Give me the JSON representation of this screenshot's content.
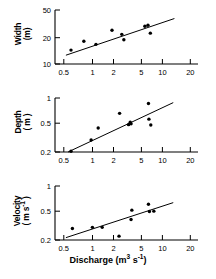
{
  "figure": {
    "xaxis_title_main": "Discharge",
    "xaxis_title_units": "(m",
    "xaxis_title_units_exp": "3",
    "xaxis_title_units_tail": " s",
    "xaxis_title_units_exp2": "-1",
    "xaxis_title_units_close": ")",
    "xaxis_title_full": "Discharge (m3 s-1)"
  },
  "panels": {
    "width": {
      "ylabel_line1": "Width",
      "ylabel_line2": "(m)",
      "yticks": [
        "10",
        "20",
        "50"
      ],
      "xticks": [
        "0.5",
        "1",
        "2",
        "5",
        "10",
        "20"
      ]
    },
    "depth": {
      "ylabel_line1": "Depth",
      "ylabel_line2": "( m )",
      "yticks": [
        "0.2",
        "0.5",
        "1"
      ],
      "xticks": [
        "0.5",
        "1",
        "2",
        "5",
        "10",
        "20"
      ]
    },
    "velocity": {
      "ylabel_line1": "Velocity",
      "ylabel_line2": "( m s-1 )",
      "ylabel_line2_pre": "( m s",
      "ylabel_line2_exp": "-1",
      "ylabel_line2_post": " )",
      "yticks": [
        "0.2",
        "0.5",
        "1"
      ],
      "xticks": [
        "0.5",
        "1",
        "2",
        "5",
        "10",
        "20"
      ]
    }
  },
  "chart_data": [
    {
      "type": "scatter",
      "title": "Width vs Discharge",
      "xlabel": "Discharge (m3 s-1)",
      "ylabel": "Width (m)",
      "xscale": "log",
      "yscale": "log",
      "xlim": [
        0.45,
        30
      ],
      "ylim": [
        10,
        55
      ],
      "xticks": [
        0.5,
        1,
        2,
        5,
        10,
        20
      ],
      "yticks": [
        10,
        20,
        50
      ],
      "grid": false,
      "legend": "none",
      "points": [
        {
          "x": 0.72,
          "y": 15.5
        },
        {
          "x": 1.05,
          "y": 20.5
        },
        {
          "x": 1.5,
          "y": 18.6
        },
        {
          "x": 2.4,
          "y": 29.0
        },
        {
          "x": 3.2,
          "y": 25.5
        },
        {
          "x": 3.4,
          "y": 21.5
        },
        {
          "x": 6.3,
          "y": 33.0
        },
        {
          "x": 6.9,
          "y": 34.0
        },
        {
          "x": 7.4,
          "y": 26.5
        }
      ],
      "fit_line": {
        "x": [
          0.62,
          15.0
        ],
        "y": [
          13.2,
          42.0
        ]
      }
    },
    {
      "type": "scatter",
      "title": "Depth vs Discharge",
      "xlabel": "Discharge (m3 s-1)",
      "ylabel": "Depth (m)",
      "xscale": "log",
      "yscale": "log",
      "xlim": [
        0.45,
        30
      ],
      "ylim": [
        0.2,
        1.15
      ],
      "xticks": [
        0.5,
        1,
        2,
        5,
        10,
        20
      ],
      "yticks": [
        0.2,
        0.5,
        1
      ],
      "grid": false,
      "legend": "none",
      "points": [
        {
          "x": 0.72,
          "y": 0.205
        },
        {
          "x": 1.3,
          "y": 0.295
        },
        {
          "x": 1.6,
          "y": 0.435
        },
        {
          "x": 3.0,
          "y": 0.7
        },
        {
          "x": 3.9,
          "y": 0.485
        },
        {
          "x": 4.1,
          "y": 0.525
        },
        {
          "x": 4.2,
          "y": 0.5
        },
        {
          "x": 7.0,
          "y": 0.96
        },
        {
          "x": 7.1,
          "y": 0.58
        },
        {
          "x": 7.5,
          "y": 0.48
        }
      ],
      "fit_line": {
        "x": [
          0.66,
          14.5
        ],
        "y": [
          0.2,
          0.99
        ]
      }
    },
    {
      "type": "scatter",
      "title": "Velocity vs Discharge",
      "xlabel": "Discharge (m3 s-1)",
      "ylabel": "Velocity (m s-1)",
      "xscale": "log",
      "yscale": "log",
      "xlim": [
        0.45,
        30
      ],
      "ylim": [
        0.2,
        1.05
      ],
      "xticks": [
        0.5,
        1,
        2,
        5,
        10,
        20
      ],
      "yticks": [
        0.2,
        0.5,
        1
      ],
      "grid": false,
      "legend": "none",
      "points": [
        {
          "x": 0.75,
          "y": 0.285
        },
        {
          "x": 1.35,
          "y": 0.295
        },
        {
          "x": 1.8,
          "y": 0.295
        },
        {
          "x": 2.95,
          "y": 0.225
        },
        {
          "x": 4.2,
          "y": 0.375
        },
        {
          "x": 4.3,
          "y": 0.5
        },
        {
          "x": 7.0,
          "y": 0.6
        },
        {
          "x": 7.2,
          "y": 0.48
        },
        {
          "x": 8.2,
          "y": 0.485
        }
      ],
      "fit_line": {
        "x": [
          0.62,
          14.5
        ],
        "y": [
          0.215,
          0.63
        ]
      }
    }
  ]
}
